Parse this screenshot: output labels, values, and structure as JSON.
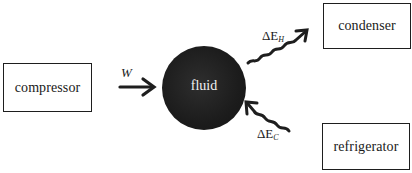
{
  "diagram": {
    "type": "refrigeration-cycle-energy-flow",
    "nodes": {
      "compressor": {
        "label": "compressor"
      },
      "fluid": {
        "label": "fluid"
      },
      "condenser": {
        "label": "condenser"
      },
      "refrigerator": {
        "label": "refrigerator"
      }
    },
    "edges": [
      {
        "from": "compressor",
        "to": "fluid",
        "label": "W",
        "style": "straight-arrow"
      },
      {
        "from": "fluid",
        "to": "condenser",
        "label_symbol": "ΔE",
        "label_sub": "H",
        "style": "wavy-arrow"
      },
      {
        "from": "refrigerator",
        "to": "fluid",
        "label_symbol": "ΔE",
        "label_sub": "C",
        "style": "wavy-arrow"
      }
    ],
    "colors": {
      "fluid_fill": "#1c1c1c",
      "fluid_text": "#f2f2f2",
      "stroke": "#1e1e1e",
      "background": "#ffffff"
    }
  }
}
